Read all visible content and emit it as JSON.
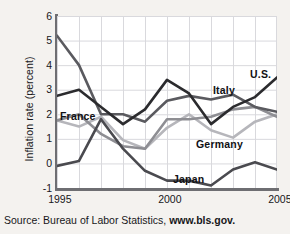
{
  "chart_data": {
    "type": "line",
    "title": "",
    "xlabel": "",
    "ylabel": "Inflation rate (percent)",
    "xlim": [
      1995,
      2005
    ],
    "ylim": [
      -1,
      6
    ],
    "grid": true,
    "legend_position": "inline-annotations",
    "x": [
      1995,
      1996,
      1997,
      1998,
      1999,
      2000,
      2001,
      2002,
      2003,
      2004,
      2005
    ],
    "xticks": [
      "1995",
      "2000",
      "2005"
    ],
    "xtick_values": [
      1995,
      2000,
      2005
    ],
    "yticks": [
      "6",
      "5",
      "4",
      "3",
      "2",
      "1",
      "0",
      "-1"
    ],
    "ytick_values": [
      6,
      5,
      4,
      3,
      2,
      1,
      0,
      -1
    ],
    "series": [
      {
        "name": "U.S.",
        "color": "#2b2b2e",
        "width": 2.6,
        "values": [
          2.75,
          3.0,
          2.3,
          1.6,
          2.2,
          3.4,
          2.85,
          1.6,
          2.3,
          2.7,
          3.5
        ]
      },
      {
        "name": "Italy",
        "color": "#5a5a5f",
        "width": 2.6,
        "values": [
          5.2,
          4.0,
          2.0,
          2.0,
          1.7,
          2.55,
          2.75,
          2.6,
          2.8,
          2.3,
          2.1
        ]
      },
      {
        "name": "France",
        "color": "#8e8e93",
        "width": 2.6,
        "values": [
          1.75,
          2.0,
          1.2,
          0.7,
          0.6,
          1.8,
          1.8,
          1.9,
          2.2,
          2.3,
          1.9
        ]
      },
      {
        "name": "Germany",
        "color": "#b6b6bb",
        "width": 2.6,
        "values": [
          1.75,
          1.5,
          1.9,
          0.95,
          0.6,
          1.45,
          2.0,
          1.35,
          1.05,
          1.7,
          2.0
        ]
      },
      {
        "name": "Japan",
        "color": "#4a4a4f",
        "width": 2.6,
        "values": [
          -0.1,
          0.1,
          1.8,
          0.6,
          -0.3,
          -0.7,
          -0.7,
          -0.9,
          -0.25,
          0.05,
          -0.25
        ]
      }
    ],
    "annotations": [
      {
        "text": "France",
        "x_px": 60,
        "y_px": 110
      },
      {
        "text": "Italy",
        "x_px": 213,
        "y_px": 84
      },
      {
        "text": "U.S.",
        "x_px": 250,
        "y_px": 68
      },
      {
        "text": "Germany",
        "x_px": 196,
        "y_px": 138
      },
      {
        "text": "Japan",
        "x_px": 173,
        "y_px": 173
      }
    ]
  },
  "source": {
    "prefix": "Source: Bureau of Labor Statistics, ",
    "url": "www.bls.gov."
  }
}
